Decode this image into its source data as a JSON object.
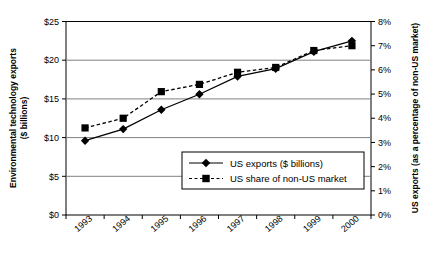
{
  "chart_data": {
    "type": "line",
    "title": "",
    "xlabel": "",
    "categories": [
      "1993",
      "1994",
      "1995",
      "1996",
      "1997",
      "1998",
      "1999",
      "2000"
    ],
    "series": [
      {
        "name": "US exports ($ billions)",
        "axis": "left",
        "marker": "diamond",
        "line_style": "solid",
        "color": "#000000",
        "values": [
          9.6,
          11.1,
          13.6,
          15.6,
          17.9,
          18.9,
          21.1,
          22.5
        ]
      },
      {
        "name": "US share of non-US market",
        "axis": "right",
        "marker": "square",
        "line_style": "dashed",
        "color": "#000000",
        "values": [
          3.6,
          4.0,
          5.1,
          5.4,
          5.9,
          6.1,
          6.8,
          7.0
        ]
      }
    ],
    "left_axis": {
      "label": "Environmental technology exports ($ billions)",
      "label_line1": "Environmental technology exports",
      "label_line2": "($ billions)",
      "ticks": [
        "$0",
        "$5",
        "$10",
        "$15",
        "$20",
        "$25"
      ],
      "tick_values": [
        0,
        5,
        10,
        15,
        20,
        25
      ],
      "ylim": [
        0,
        25
      ]
    },
    "right_axis": {
      "label": "US exports (as a percentage of non-US market)",
      "ticks": [
        "0%",
        "1%",
        "2%",
        "3%",
        "4%",
        "5%",
        "6%",
        "7%",
        "8%"
      ],
      "tick_values": [
        0,
        1,
        2,
        3,
        4,
        5,
        6,
        7,
        8
      ],
      "ylim": [
        0,
        8
      ]
    },
    "grid": {
      "horizontal": true,
      "vertical": false,
      "color": "#808080"
    },
    "legend": {
      "position": "inside-bottom-right",
      "entries": [
        {
          "label": "US exports ($ billions)",
          "marker": "diamond",
          "line_style": "solid"
        },
        {
          "label": "US share of non-US market",
          "marker": "square",
          "line_style": "dashed"
        }
      ]
    }
  }
}
